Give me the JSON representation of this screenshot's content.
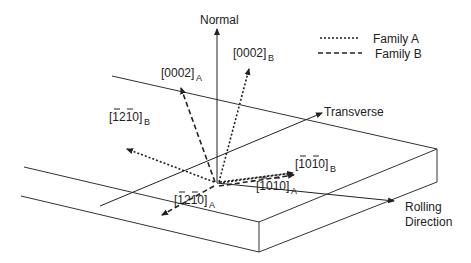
{
  "legend": {
    "items": [
      {
        "label": "Family A",
        "style": "dotted"
      },
      {
        "label": "Family B",
        "style": "dashed"
      }
    ]
  },
  "axes": {
    "normal": "Normal",
    "transverse": "Transverse",
    "rolling_line1": "Rolling",
    "rolling_line2": "Direction"
  },
  "directions": {
    "c_A": {
      "main": "[0002]",
      "sub": "A"
    },
    "c_B": {
      "main": "[0002]",
      "sub": "B"
    },
    "a_B": {
      "main": "[1210]",
      "sub": "B",
      "overbars": "-1 2 -1 0"
    },
    "a_A": {
      "main": "[1210]",
      "sub": "A",
      "overbars": "-1 2 -1 0"
    },
    "m_B": {
      "main": "[1010]",
      "sub": "B",
      "overbars": "-1 0 -1 0"
    },
    "m_A": {
      "main": "[1010]",
      "sub": "A",
      "overbars": "-1 0 -1 0"
    }
  },
  "colors": {
    "ink": "#222222",
    "background": "#ffffff"
  }
}
